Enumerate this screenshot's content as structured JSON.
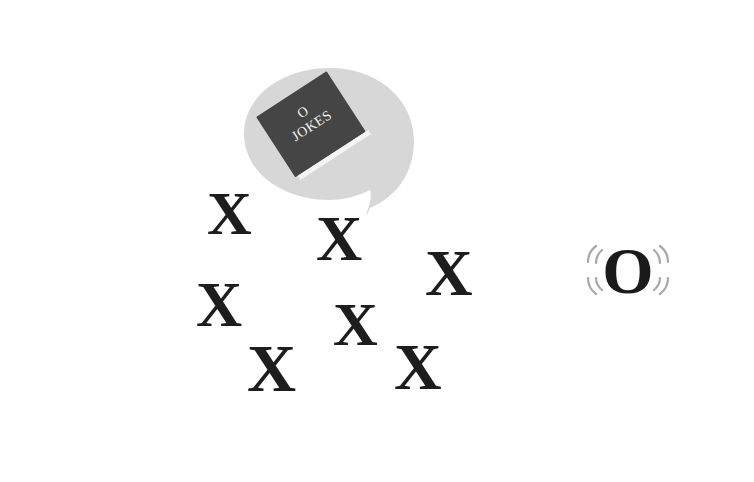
{
  "scene": {
    "background": "#ffffff",
    "speech_bubble": {
      "color": "#d7d7d7",
      "book": {
        "cover_color": "#454545",
        "pages_color": "#f4f4f4",
        "title_line_1": "O",
        "title_line_2": "JOKES"
      }
    },
    "x_marks": [
      {
        "label": "X",
        "left": 207,
        "top": 182,
        "size": 62
      },
      {
        "label": "X",
        "left": 316,
        "top": 207,
        "size": 64
      },
      {
        "label": "X",
        "left": 425,
        "top": 240,
        "size": 66
      },
      {
        "label": "X",
        "left": 196,
        "top": 273,
        "size": 64
      },
      {
        "label": "X",
        "left": 247,
        "top": 334,
        "size": 68
      },
      {
        "label": "X",
        "left": 333,
        "top": 293,
        "size": 62
      },
      {
        "label": "X",
        "left": 394,
        "top": 334,
        "size": 66
      }
    ],
    "o_mark": {
      "label": "O",
      "vibration_color": "#a8a8a8"
    }
  }
}
